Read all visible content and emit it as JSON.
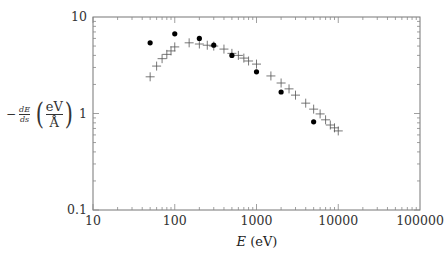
{
  "chart_data": {
    "type": "scatter",
    "title": "",
    "xlabel": "E (eV)",
    "ylabel": "-dE/ds (eV/Å)",
    "xscale": "log",
    "yscale": "log",
    "xlim": [
      10,
      100000
    ],
    "ylim": [
      0.1,
      10
    ],
    "x_tick_labels": [
      "10",
      "100",
      "1000",
      "10000",
      "100000"
    ],
    "y_tick_labels": [
      "0.1",
      "1",
      "10"
    ],
    "grid": false,
    "legend": null,
    "series": [
      {
        "name": "dots",
        "marker": "filled-circle",
        "x": [
          50,
          100,
          200,
          300,
          500,
          1000,
          2000,
          5000
        ],
        "y": [
          5.4,
          6.7,
          6.0,
          5.1,
          4.0,
          2.7,
          1.67,
          0.82
        ]
      },
      {
        "name": "crosses",
        "marker": "plus",
        "x": [
          50,
          60,
          70,
          80,
          90,
          100,
          150,
          200,
          250,
          300,
          400,
          500,
          600,
          700,
          800,
          1000,
          1500,
          2000,
          2500,
          3000,
          4000,
          5000,
          6000,
          7000,
          8000,
          9000,
          10000
        ],
        "y": [
          2.4,
          3.1,
          3.7,
          4.1,
          4.45,
          4.9,
          5.4,
          5.25,
          5.1,
          5.0,
          4.65,
          4.2,
          4.0,
          3.75,
          3.5,
          3.25,
          2.45,
          2.07,
          1.8,
          1.55,
          1.28,
          1.11,
          0.99,
          0.86,
          0.76,
          0.71,
          0.66
        ]
      }
    ]
  },
  "labels": {
    "x_axis_var": "E",
    "x_axis_unit": " (eV)",
    "y_minus": "−",
    "y_frac_num": "dE",
    "y_frac_den": "ds",
    "y_unit_num": "eV",
    "y_unit_den": "Å",
    "paren_open": "(",
    "paren_close": ")"
  }
}
